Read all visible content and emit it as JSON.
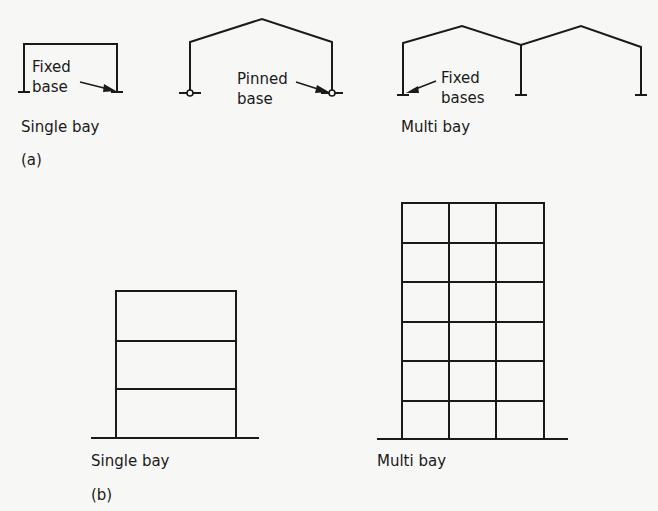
{
  "figure": {
    "part_a": {
      "label": "(a)",
      "single_bay_fixed": {
        "caption": "Single bay",
        "annotation_line1": "Fixed",
        "annotation_line2": "base"
      },
      "single_bay_pinned": {
        "annotation_line1": "Pinned",
        "annotation_line2": "base"
      },
      "multi_bay": {
        "caption": "Multi bay",
        "annotation_line1": "Fixed",
        "annotation_line2": "bases"
      }
    },
    "part_b": {
      "label": "(b)",
      "single_bay": {
        "caption": "Single bay",
        "storeys": 3,
        "bays": 1
      },
      "multi_bay": {
        "caption": "Multi bay",
        "storeys": 6,
        "bays": 3
      }
    }
  },
  "colors": {
    "line": "#1a1a1a",
    "background": "#f7f7f5"
  }
}
